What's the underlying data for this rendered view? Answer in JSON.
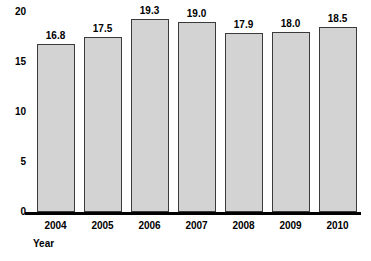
{
  "chart_data": {
    "type": "bar",
    "title": "",
    "subtitle": "",
    "xlabel": "Year",
    "ylabel": "",
    "categories": [
      "2004",
      "2005",
      "2006",
      "2007",
      "2008",
      "2009",
      "2010"
    ],
    "values": [
      16.8,
      17.5,
      19.3,
      19.0,
      17.9,
      18.0,
      18.5
    ],
    "value_labels": [
      "16.8",
      "17.5",
      "19.3",
      "19.0",
      "17.9",
      "18.0",
      "18.5"
    ],
    "ylim": [
      0,
      20
    ],
    "y_ticks": [
      0,
      5,
      10,
      15,
      20
    ],
    "y_tick_labels": [
      "0",
      "5",
      "10",
      "15",
      "20"
    ],
    "grid": false,
    "legend": null,
    "legend_position": "none",
    "annotations": [],
    "colors": {
      "bar_fill": "#d3d3d3",
      "bar_stroke": "#3a3a3a",
      "axis": "#000000",
      "text": "#000000",
      "background": "#ffffff"
    }
  },
  "axes": {
    "x_title": "Year"
  }
}
